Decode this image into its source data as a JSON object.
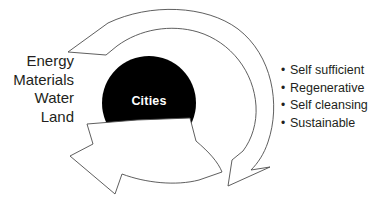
{
  "diagram": {
    "center": {
      "label": "Cities",
      "fill_color": "#000000",
      "text_color": "#ffffff"
    },
    "inputs": {
      "items": [
        {
          "label": "Energy"
        },
        {
          "label": "Materials"
        },
        {
          "label": "Water"
        },
        {
          "label": "Land"
        }
      ]
    },
    "outcomes": {
      "bullet": "•",
      "items": [
        {
          "label": "Self sufficient"
        },
        {
          "label": "Regenerative"
        },
        {
          "label": "Self cleansing"
        },
        {
          "label": "Sustainable"
        }
      ]
    },
    "arrows": {
      "outer_ring": {
        "name": "circular-flow-arrow",
        "stroke_color": "#4d4d4d",
        "fill_color": "#ffffff"
      },
      "inner": {
        "name": "output-arrow",
        "stroke_color": "#4d4d4d",
        "fill_color": "#ffffff"
      }
    },
    "colors": {
      "text": "#231f20",
      "stroke": "#4d4d4d",
      "background": "#ffffff"
    }
  }
}
